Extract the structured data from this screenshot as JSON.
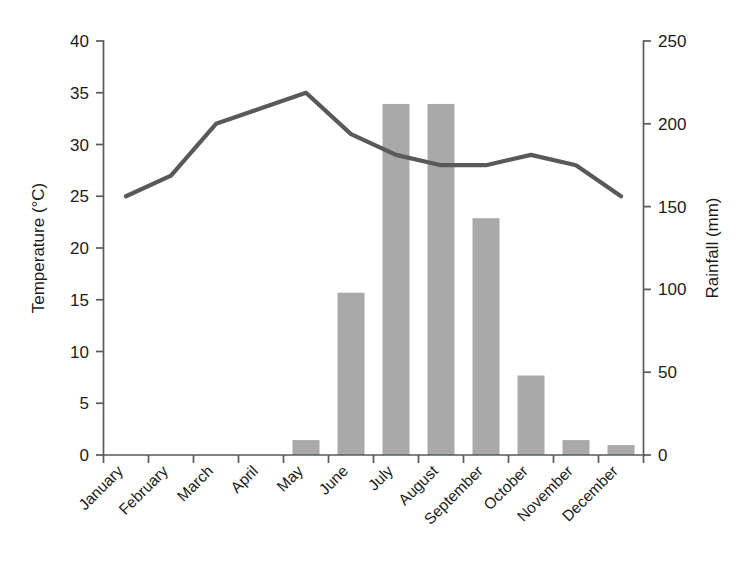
{
  "chart_data": {
    "type": "bar",
    "title": "",
    "subtitle": "",
    "categories": [
      "January",
      "February",
      "March",
      "April",
      "May",
      "June",
      "July",
      "August",
      "September",
      "October",
      "November",
      "December"
    ],
    "series": [
      {
        "name": "Rainfall",
        "type": "bar",
        "axis": "right",
        "unit": "mm",
        "values": [
          0,
          0,
          0,
          0,
          9,
          98,
          212,
          212,
          143,
          48,
          9,
          6
        ]
      },
      {
        "name": "Temperature",
        "type": "line",
        "axis": "left",
        "unit": "°C",
        "values": [
          25,
          27,
          32,
          33.5,
          35,
          31,
          29,
          28,
          28,
          29,
          28,
          25
        ]
      }
    ],
    "xlabel": "",
    "ylabel": "Temperature (°C)",
    "y2label": "Rainfall (mm)",
    "ylim": [
      0,
      40
    ],
    "y2lim": [
      0,
      250
    ],
    "yticks": [
      "0",
      "5",
      "10",
      "15",
      "20",
      "25",
      "30",
      "35",
      "40"
    ],
    "y2ticks": [
      "0",
      "50",
      "100",
      "150",
      "200",
      "250"
    ],
    "grid": false,
    "legend": "none",
    "colors": {
      "bar": "#a9a9a9",
      "line": "#58595b",
      "axis": "#555b5e",
      "text": "#1b1b1b",
      "background": "#ffffff"
    }
  },
  "axes": {
    "left": {
      "title": "Temperature (°C)",
      "ticks": [
        "0",
        "5",
        "10",
        "15",
        "20",
        "25",
        "30",
        "35",
        "40"
      ]
    },
    "right": {
      "title": "Rainfall (mm)",
      "ticks": [
        "0",
        "50",
        "100",
        "150",
        "200",
        "250"
      ]
    },
    "bottom": {
      "ticks": [
        "January",
        "February",
        "March",
        "April",
        "May",
        "June",
        "July",
        "August",
        "September",
        "October",
        "November",
        "December"
      ]
    }
  }
}
